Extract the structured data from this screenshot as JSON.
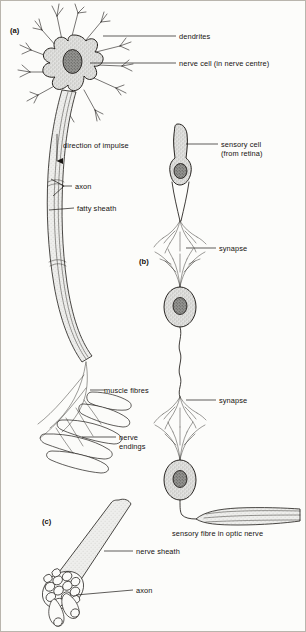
{
  "figure": {
    "background_color": "#fcfcfa",
    "ink_color": "#1d1a17",
    "soma_fill_color": "#d8d8d8",
    "nucleus_fill_color": "#8a8a8a",
    "sheath_fill_color": "#e4e4e2"
  },
  "sections": {
    "a": {
      "tag": "(a)",
      "description": "motor nerve cell with dendrites, axon and nerve endings on muscle fibres"
    },
    "b": {
      "tag": "(b)",
      "description": "chain of sensory neurones from retina to optic nerve linked by synapses"
    },
    "c": {
      "tag": "(c)",
      "description": "cut end of a nerve showing sheath and bundled axons"
    }
  },
  "labels": {
    "dendrites": "dendrites",
    "nerve_cell": "nerve cell (in nerve centre)",
    "direction_of_impulse": "direction of impulse",
    "axon_top": "axon",
    "fatty_sheath": "fatty sheath",
    "muscle_fibres": "muscle fibres",
    "nerve_endings_line1": "nerve",
    "nerve_endings_line2": "endings",
    "sensory_cell_line1": "sensory cell",
    "sensory_cell_line2": "(from retina)",
    "synapse_upper": "synapse",
    "synapse_lower": "synapse",
    "sensory_fibre": "sensory fibre in optic nerve",
    "nerve_sheath": "nerve sheath",
    "axon_bottom": "axon"
  }
}
